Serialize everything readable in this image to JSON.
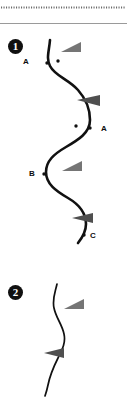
{
  "figure": {
    "width": 127,
    "height": 397,
    "background_color": "#ffffff",
    "ink_color": "#111111",
    "arrow_color": "#757575",
    "dot_color": "#111111",
    "badge_color": "#101010",
    "badge_text_color": "#ffffff",
    "divider": {
      "dotted_rule_name": "dotted-separator",
      "dotted_rule_y": 7,
      "dotted_rule_color": "#6b6b6b",
      "solid_rule_y": 23,
      "solid_rule_color": "#8c8c8c"
    }
  },
  "panels": [
    {
      "badge": "1",
      "curve_name": "sinuous-curve-1",
      "curve_stroke_width": 2.6,
      "labels": [
        {
          "id": "A1",
          "text": "A",
          "x": 23,
          "y": 57
        },
        {
          "id": "A2",
          "text": "A",
          "x": 101,
          "y": 124
        },
        {
          "id": "B",
          "text": "B",
          "x": 29,
          "y": 169
        },
        {
          "id": "C",
          "text": "C",
          "x": 90,
          "y": 231
        }
      ],
      "dots": [
        {
          "name": "marker-dot-a1-left",
          "x": 47,
          "y": 63,
          "r": 1.7
        },
        {
          "name": "marker-dot-a1-right",
          "x": 58,
          "y": 61,
          "r": 1.7
        },
        {
          "name": "marker-dot-a2-left",
          "x": 76,
          "y": 126,
          "r": 1.7
        },
        {
          "name": "marker-dot-a2-right",
          "x": 90,
          "y": 128,
          "r": 1.7
        },
        {
          "name": "marker-dot-b",
          "x": 44,
          "y": 174,
          "r": 1.7
        },
        {
          "name": "marker-dot-c",
          "x": 84,
          "y": 235,
          "r": 1.7
        }
      ],
      "arrows": [
        {
          "name": "arrowhead-1",
          "x": 61,
          "y": 43,
          "w": 20,
          "h": 10,
          "dir": "left"
        },
        {
          "name": "arrowhead-2",
          "x": 77,
          "y": 95,
          "w": 23,
          "h": 11,
          "dir": "right"
        },
        {
          "name": "arrowhead-3",
          "x": 62,
          "y": 161,
          "w": 20,
          "h": 10,
          "dir": "left"
        },
        {
          "name": "arrowhead-4",
          "x": 72,
          "y": 213,
          "w": 21,
          "h": 10,
          "dir": "right"
        }
      ]
    },
    {
      "badge": "2",
      "curve_name": "sinuous-curve-2",
      "curve_stroke_width": 1.7,
      "labels": [],
      "dots": [],
      "arrows": [
        {
          "name": "arrowhead-5",
          "x": 64,
          "y": 299,
          "w": 20,
          "h": 10,
          "dir": "left"
        },
        {
          "name": "arrowhead-6",
          "x": 44,
          "y": 348,
          "w": 20,
          "h": 10,
          "dir": "right"
        }
      ]
    }
  ]
}
